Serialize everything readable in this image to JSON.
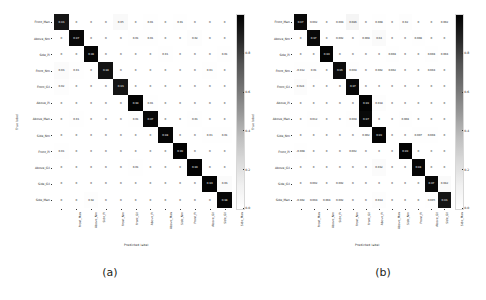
{
  "figure": {
    "background": "#ffffff",
    "colormap": "Greys",
    "panels": [
      {
        "caption": "(a)"
      },
      {
        "caption": "(b)"
      }
    ]
  },
  "axis_titles": {
    "x": "Predicted label",
    "y": "True label"
  },
  "colorbar": {
    "ticks": [
      "0.8",
      "0.6",
      "0.4",
      "0.2",
      "0.0"
    ],
    "tick_values": [
      0.8,
      0.6,
      0.4,
      0.2,
      0.0
    ],
    "vmin": 0.0,
    "vmax": 1.0,
    "top_color": "#1a1a1a",
    "bottom_color": "#ffffff"
  },
  "chart_data": [
    {
      "type": "heatmap",
      "title": "(a)",
      "xlabel": "Predicted label",
      "ylabel": "True label",
      "colormap": "Greys",
      "vmin": 0.0,
      "vmax": 1.0,
      "grid": false,
      "legend": "colorbar-right",
      "categories": [
        "Front_Man",
        "Above_Nm",
        "Side_Pi",
        "Front_Nm",
        "Front_Gil",
        "Above_Pi",
        "Above_Man",
        "Side_Nm",
        "Front_Pi",
        "Above_Gil",
        "Side_Gil",
        "Side_Man"
      ],
      "xticklabels": [
        "Front_Man",
        "Above_Nm",
        "Side_Pi",
        "Front_Nm",
        "Front_Gil",
        "Above_Pi",
        "Above_Man",
        "Side_Nm",
        "Front_Pi",
        "Above_Gil",
        "Side_Gil",
        "Side_Man"
      ],
      "yticklabels": [
        "Front_Man",
        "Above_Nm",
        "Side_Pi",
        "Front_Nm",
        "Front_Gil",
        "Above_Pi",
        "Above_Man",
        "Side_Nm",
        "Front_Pi",
        "Above_Gil",
        "Side_Gil",
        "Side_Man"
      ],
      "matrix": [
        [
          0.93,
          0,
          0,
          0,
          0.05,
          0,
          0.01,
          0,
          0.01,
          0,
          0,
          0
        ],
        [
          0,
          0.97,
          0,
          0,
          0,
          0.01,
          0.01,
          0,
          0,
          0.02,
          0,
          0
        ],
        [
          0,
          0,
          0.98,
          0,
          0,
          0,
          0,
          0.01,
          0,
          0,
          0,
          0.01
        ],
        [
          0.03,
          0.01,
          0,
          0.94,
          0,
          0,
          0,
          0,
          0,
          0,
          0.01,
          0
        ],
        [
          0.02,
          0,
          0,
          0,
          0.93,
          0,
          0,
          0,
          0,
          0,
          0,
          0
        ],
        [
          0,
          0,
          0,
          0,
          0,
          0.99,
          0.01,
          0,
          0,
          0,
          0,
          0
        ],
        [
          0,
          0.01,
          0,
          0,
          0,
          0.01,
          0.97,
          0,
          0,
          0.01,
          0,
          0
        ],
        [
          0,
          0,
          0,
          0,
          0,
          0,
          0,
          0.98,
          0,
          0,
          0.01,
          0.01
        ],
        [
          0.01,
          0,
          0,
          0,
          0,
          0,
          0,
          0,
          0.99,
          0,
          0,
          0
        ],
        [
          0,
          0,
          0,
          0,
          0,
          0.01,
          0,
          0,
          0,
          0.99,
          0,
          0
        ],
        [
          0,
          0,
          0,
          0,
          0,
          0,
          0,
          0,
          0,
          0,
          0.99,
          0.03
        ],
        [
          0,
          0,
          0.02,
          0,
          0,
          0,
          0,
          0,
          0,
          0,
          0,
          0.98
        ]
      ],
      "cell_text": [
        [
          "0.93",
          "0",
          "0",
          "0",
          "0.05",
          "0",
          "0.01",
          "0",
          "0.01",
          "0",
          "0",
          "0"
        ],
        [
          "0",
          "0.97",
          "0",
          "0",
          "0",
          "0.01",
          "0.01",
          "0",
          "0",
          "0.02",
          "0",
          "0"
        ],
        [
          "0",
          "0",
          "0.98",
          "0",
          "0",
          "0",
          "0",
          "0.01",
          "0",
          "0",
          "0",
          "0.01"
        ],
        [
          "0.03",
          "0.01",
          "0",
          "0.94",
          "0",
          "0",
          "0",
          "0",
          "0",
          "0",
          "0.01",
          "0"
        ],
        [
          "0.02",
          "0",
          "0",
          "0",
          "0.93",
          "0",
          "0",
          "0",
          "0",
          "0",
          "0",
          "0"
        ],
        [
          "0",
          "0",
          "0",
          "0",
          "0",
          "0.99",
          "0.01",
          "0",
          "0",
          "0",
          "0",
          "0"
        ],
        [
          "0",
          "0.01",
          "0",
          "0",
          "0",
          "0.01",
          "0.97",
          "0",
          "0",
          "0.01",
          "0",
          "0"
        ],
        [
          "0",
          "0",
          "0",
          "0",
          "0",
          "0",
          "0",
          "0.98",
          "0",
          "0",
          "0.01",
          "0.01"
        ],
        [
          "0.01",
          "0",
          "0",
          "0",
          "0",
          "0",
          "0",
          "0",
          "0.99",
          "0",
          "0",
          "0"
        ],
        [
          "0",
          "0",
          "0",
          "0",
          "0",
          "0.01",
          "0",
          "0",
          "0",
          "0.99",
          "0",
          "0"
        ],
        [
          "0",
          "0",
          "0",
          "0",
          "0",
          "0",
          "0",
          "0",
          "0",
          "0",
          "0.99",
          "0.03"
        ],
        [
          "0",
          "0",
          "0.02",
          "0",
          "0",
          "0",
          "0",
          "0",
          "0",
          "0",
          "0",
          "0.98"
        ]
      ]
    },
    {
      "type": "heatmap",
      "title": "(b)",
      "xlabel": "Predicted label",
      "ylabel": "True label",
      "colormap": "Greys",
      "vmin": 0.0,
      "vmax": 1.0,
      "grid": false,
      "legend": "colorbar-right",
      "categories": [
        "Front_Man",
        "Above_Nm",
        "Side_Pi",
        "Front_Nm",
        "Front_Gil",
        "Above_Pi",
        "Above_Man",
        "Side_Nm",
        "Front_Pi",
        "Above_Gil",
        "Side_Gil",
        "Side_Man"
      ],
      "xticklabels": [
        "Front_Man",
        "Above_Nm",
        "Side_Pi",
        "Front_Nm",
        "Front_Gil",
        "Above_Pi",
        "Above_Man",
        "Side_Nm",
        "Front_Pi",
        "Above_Gil",
        "Side_Gil",
        "Side_Man"
      ],
      "yticklabels": [
        "Front_Man",
        "Above_Nm",
        "Side_Pi",
        "Front_Nm",
        "Front_Gil",
        "Above_Pi",
        "Above_Man",
        "Side_Nm",
        "Front_Pi",
        "Above_Gil",
        "Side_Gil",
        "Side_Man"
      ],
      "matrix": [
        [
          0.97,
          0.002,
          0,
          0.004,
          0.086,
          0,
          0.008,
          0,
          0.02,
          0,
          0,
          0.002
        ],
        [
          0,
          0.97,
          0,
          0.002,
          0,
          0.008,
          0.04,
          0,
          0,
          0.008,
          0,
          0
        ],
        [
          0,
          0,
          0.99,
          0,
          0,
          0,
          0,
          0.008,
          0,
          0,
          0.008,
          0.004
        ],
        [
          0.012,
          0.01,
          0,
          0.96,
          0.008,
          0,
          0.002,
          0.002,
          0,
          0,
          0.004,
          0
        ],
        [
          0.024,
          0,
          0,
          0,
          0.97,
          0,
          0,
          0,
          0,
          0,
          0,
          0
        ],
        [
          0,
          0,
          0,
          0,
          0,
          0.99,
          0.018,
          0,
          0,
          0,
          0,
          0
        ],
        [
          0,
          0.012,
          0,
          0,
          0.008,
          0.97,
          0,
          0,
          0.008,
          0,
          0,
          0
        ],
        [
          0,
          0,
          0,
          0,
          0,
          0.002,
          0.99,
          0,
          0,
          0.007,
          0.008,
          0
        ],
        [
          0.008,
          0,
          0,
          0,
          0.002,
          0,
          0,
          0,
          0.99,
          0,
          0,
          0
        ],
        [
          0,
          0,
          0,
          0,
          0,
          0,
          0.032,
          0,
          0,
          0.98,
          0,
          0
        ],
        [
          0,
          0.002,
          0,
          0.002,
          0,
          0,
          0,
          0,
          0,
          0,
          0.97,
          0.042
        ],
        [
          0.002,
          0.004,
          0.004,
          0.002,
          0,
          0,
          0.014,
          0,
          0,
          0,
          0.005,
          0.93
        ]
      ],
      "cell_text": [
        [
          "0.97",
          "0.002",
          "0",
          "0.004",
          "0.086",
          "0",
          "0.008",
          "0",
          "0.02",
          "0",
          "0",
          "0.002"
        ],
        [
          "0",
          "0.97",
          "0",
          "0.002",
          "0",
          "0.008",
          "0.04",
          "0",
          "0",
          "0.008",
          "0",
          "0"
        ],
        [
          "0",
          "0",
          "0.99",
          "0",
          "0",
          "0",
          "0",
          "0.008",
          "0",
          "0",
          "0.008",
          "0.004"
        ],
        [
          "-0.012",
          "0.01",
          "0",
          "0.96",
          "0.008",
          "0",
          "0.002",
          "0.002",
          "0",
          "0",
          "0.004",
          "0"
        ],
        [
          "0.024",
          "0",
          "0",
          "0",
          "0.97",
          "0",
          "0",
          "0",
          "0",
          "0",
          "0",
          "0"
        ],
        [
          "0",
          "0",
          "0",
          "0",
          "0",
          "0.99",
          "0.018",
          "0",
          "0",
          "0",
          "0",
          "0"
        ],
        [
          "0",
          "0.012",
          "0",
          "0",
          "0.008",
          "0.97",
          "0",
          "0",
          "0.008",
          "0",
          "0",
          "0"
        ],
        [
          "0",
          "0",
          "0",
          "0",
          "0",
          "0.002",
          "0.99",
          "0",
          "0",
          "0.007",
          "0.008",
          "0"
        ],
        [
          "-0.008",
          "0",
          "0",
          "0",
          "0.002",
          "0",
          "0",
          "0",
          "0.99",
          "0",
          "0",
          "0"
        ],
        [
          "0",
          "0",
          "0",
          "0",
          "0",
          "0",
          "0.032",
          "0",
          "0",
          "0.98",
          "0",
          "0"
        ],
        [
          "0",
          "0.002",
          "0",
          "0.002",
          "0",
          "0",
          "0",
          "0",
          "0",
          "0",
          "0.97",
          "0.042"
        ],
        [
          "-0.002",
          "0.004",
          "0.004",
          "0.002",
          "0",
          "0",
          "0.014",
          "0",
          "0",
          "0",
          "0.005",
          "0.93"
        ]
      ]
    }
  ]
}
